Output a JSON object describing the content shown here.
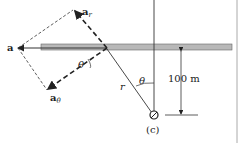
{
  "figure": {
    "caption": "(c)",
    "labels": {
      "a": "a",
      "a_r_main": "a",
      "a_r_sub": "r",
      "a_theta_main": "a",
      "a_theta_sub": "θ",
      "theta_1": "θ",
      "theta_2": "θ",
      "r": "r",
      "distance": "100 m"
    },
    "colors": {
      "bar_fill": "#b8b8b8",
      "bar_stroke": "#666666",
      "line": "#333333"
    }
  }
}
